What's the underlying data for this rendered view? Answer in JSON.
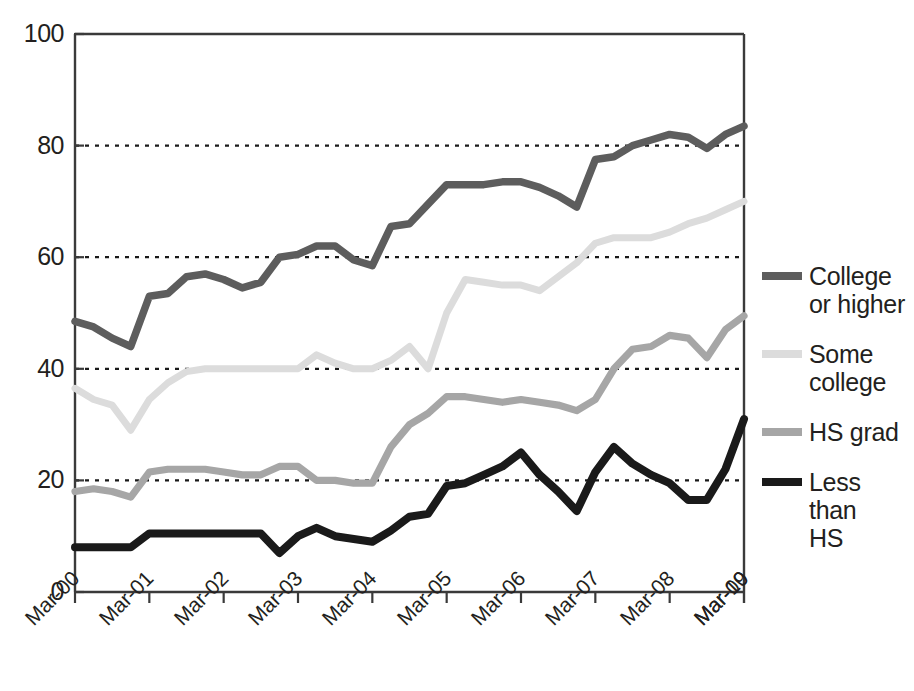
{
  "chart_data": {
    "type": "line",
    "title": "",
    "xlabel": "",
    "ylabel": "",
    "ylim": [
      0,
      100
    ],
    "yticks": [
      0,
      20,
      40,
      60,
      80,
      100
    ],
    "grid": "horizontal-dotted",
    "legend_position": "right",
    "xtick_labels": [
      "Mar-00",
      "Mar-01",
      "Mar-02",
      "Mar-03",
      "Mar-04",
      "Mar-05",
      "Mar-06",
      "Mar-07",
      "Mar-08",
      "Mar-09",
      "Mar-10"
    ],
    "x_points_per_year": 4,
    "x_note": "quarterly points; ticks every 4th point labeled Mar-00..Mar-10",
    "series": [
      {
        "name": "College or higher",
        "color": "#5d5d5d",
        "values": [
          48.5,
          47.5,
          45.5,
          44.0,
          53.0,
          53.5,
          56.5,
          57.0,
          56.0,
          54.5,
          55.5,
          60.0,
          60.5,
          62.0,
          62.0,
          59.5,
          58.5,
          65.5,
          66.0,
          69.5,
          73.0,
          73.0,
          73.0,
          73.5,
          73.5,
          72.5,
          71.0,
          69.0,
          77.5,
          78.0,
          80.0,
          81.0,
          82.0,
          81.5,
          79.5,
          82.0,
          83.5
        ]
      },
      {
        "name": "Some college",
        "color": "#dcdcdc",
        "values": [
          36.5,
          34.5,
          33.5,
          29.0,
          34.5,
          37.5,
          39.5,
          40.0,
          40.0,
          40.0,
          40.0,
          40.0,
          40.0,
          42.5,
          41.0,
          40.0,
          40.0,
          41.5,
          44.0,
          40.0,
          50.0,
          56.0,
          55.5,
          55.0,
          55.0,
          54.0,
          56.5,
          59.0,
          62.5,
          63.5,
          63.5,
          63.5,
          64.5,
          66.0,
          67.0,
          68.5,
          70.0
        ]
      },
      {
        "name": "HS grad",
        "color": "#a6a6a6",
        "values": [
          18.0,
          18.5,
          18.0,
          17.0,
          21.5,
          22.0,
          22.0,
          22.0,
          21.5,
          21.0,
          21.0,
          22.5,
          22.5,
          20.0,
          20.0,
          19.5,
          19.5,
          26.0,
          30.0,
          32.0,
          35.0,
          35.0,
          34.5,
          34.0,
          34.5,
          34.0,
          33.5,
          32.5,
          34.5,
          40.0,
          43.5,
          44.0,
          46.0,
          45.5,
          42.0,
          47.0,
          49.5
        ]
      },
      {
        "name": "Less than HS",
        "color": "#1a1a1a",
        "values": [
          8.0,
          8.0,
          8.0,
          8.0,
          10.5,
          10.5,
          10.5,
          10.5,
          10.5,
          10.5,
          10.5,
          7.0,
          10.0,
          11.5,
          10.0,
          9.5,
          9.0,
          11.0,
          13.5,
          14.0,
          19.0,
          19.5,
          21.0,
          22.5,
          25.0,
          21.0,
          18.0,
          14.5,
          21.5,
          26.0,
          23.0,
          21.0,
          19.5,
          16.5,
          16.5,
          22.0,
          31.0
        ]
      }
    ]
  },
  "legend": {
    "items": [
      {
        "label": "College\nor higher",
        "line1": "College",
        "line2": "or higher",
        "color": "#5d5d5d"
      },
      {
        "label": "Some\ncollege",
        "line1": "Some",
        "line2": "college",
        "color": "#dcdcdc"
      },
      {
        "label": "HS grad",
        "line1": "HS grad",
        "line2": "",
        "color": "#a6a6a6"
      },
      {
        "label": "Less than\nHS",
        "line1": "Less than",
        "line2": "HS",
        "color": "#1a1a1a"
      }
    ]
  },
  "axes": {
    "y_labels": [
      "100",
      "80",
      "60",
      "40",
      "20",
      "0"
    ],
    "x_labels": [
      "Mar-00",
      "Mar-01",
      "Mar-02",
      "Mar-03",
      "Mar-04",
      "Mar-05",
      "Mar-06",
      "Mar-07",
      "Mar-08",
      "Mar-09",
      "Mar-10"
    ]
  }
}
